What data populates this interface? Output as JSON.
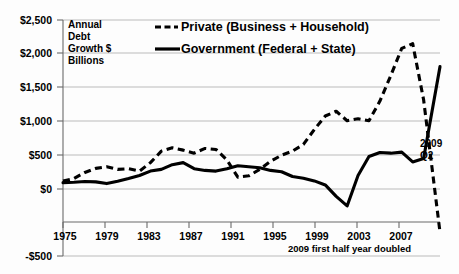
{
  "chart_data": {
    "type": "line",
    "title": "",
    "ylabel_block": [
      "Annual",
      "Debt",
      "Growth $",
      "Billions"
    ],
    "xlabel": "",
    "ylim": [
      -500,
      2500
    ],
    "xlim": [
      1975,
      2009.5
    ],
    "grid": true,
    "legend_position": "top-center",
    "yticks": [
      -500,
      0,
      500,
      1000,
      1500,
      2000,
      2500
    ],
    "ytick_labels": [
      "-$500",
      "$0",
      "$500",
      "$1,000",
      "$1,500",
      "$2,000",
      "$2,500"
    ],
    "xticks": [
      1975,
      1979,
      1983,
      1987,
      1991,
      1995,
      1999,
      2003,
      2007
    ],
    "xtick_labels": [
      "1975",
      "1979",
      "1983",
      "1987",
      "1991",
      "1995",
      "1999",
      "2003",
      "2007"
    ],
    "series": [
      {
        "name": "Private  (Business + Household)",
        "style": "dashed",
        "x": [
          1975,
          1976,
          1977,
          1978,
          1979,
          1980,
          1981,
          1982,
          1983,
          1984,
          1985,
          1986,
          1987,
          1988,
          1989,
          1990,
          1991,
          1992,
          1993,
          1994,
          1995,
          1996,
          1997,
          1998,
          1999,
          2000,
          2001,
          2002,
          2003,
          2004,
          2005,
          2006,
          2007,
          2008,
          2009.5
        ],
        "values": [
          120,
          155,
          245,
          305,
          330,
          290,
          300,
          265,
          390,
          560,
          610,
          575,
          530,
          600,
          585,
          430,
          175,
          195,
          290,
          410,
          500,
          560,
          660,
          880,
          1080,
          1150,
          1010,
          1040,
          1010,
          1300,
          1680,
          2080,
          2150,
          1320,
          -640
        ]
      },
      {
        "name": "Government (Federal + State)",
        "style": "solid",
        "x": [
          1975,
          1976,
          1977,
          1978,
          1979,
          1980,
          1981,
          1982,
          1983,
          1984,
          1985,
          1986,
          1987,
          1988,
          1989,
          1990,
          1991,
          1992,
          1993,
          1994,
          1995,
          1996,
          1997,
          1998,
          1999,
          2000,
          2001,
          2002,
          2003,
          2004,
          2005,
          2006,
          2007,
          2008,
          2009.5
        ],
        "values": [
          95,
          100,
          110,
          105,
          80,
          115,
          155,
          200,
          265,
          290,
          360,
          390,
          300,
          275,
          265,
          300,
          345,
          330,
          315,
          275,
          255,
          185,
          160,
          120,
          60,
          -110,
          -250,
          200,
          480,
          540,
          530,
          545,
          400,
          450,
          1810
        ]
      }
    ],
    "annotations": [
      {
        "text": "2009\nQ2",
        "x": 2009.2,
        "y": 900
      },
      {
        "text": "2009 first half year doubled",
        "x": 2003.2,
        "y": -330
      }
    ]
  },
  "legend": {
    "entries": [
      {
        "label": "Private  (Business + Household)",
        "style": "dashed",
        "color": "#000000"
      },
      {
        "label": "Government (Federal + State)",
        "style": "solid",
        "color": "#000000"
      }
    ]
  },
  "axis_block": {
    "line1": "Annual",
    "line2": "Debt",
    "line3": "Growth $",
    "line4": "Billions"
  },
  "annotations": {
    "q2_line1": "2009",
    "q2_line2": "Q2",
    "footnote": "2009 first half year doubled"
  },
  "colors": {
    "ink": "#000000",
    "grid": "#a9a9a9",
    "axis": "#6b6b6b",
    "background": "#fdfdfd"
  }
}
